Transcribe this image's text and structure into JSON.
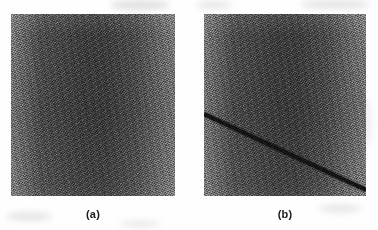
{
  "figure": {
    "width": 378,
    "height": 230,
    "background_color": "#fefefe",
    "panels": [
      {
        "id": "panel-a",
        "caption": "(a)",
        "x": 11,
        "y": 14,
        "width": 164,
        "height": 182,
        "description": "uniform grainy grayscale texture, no defect",
        "mean_gray": "#4c4c4c",
        "edge_gray": "#7a7a7a",
        "center_gray": "#3c3c3c",
        "has_defect": false
      },
      {
        "id": "panel-b",
        "caption": "(b)",
        "x": 204,
        "y": 14,
        "width": 162,
        "height": 182,
        "description": "same grainy grayscale texture with a dark diagonal line defect crossing from the left edge downward to the right edge",
        "mean_gray": "#4c4c4c",
        "edge_gray": "#7a7a7a",
        "center_gray": "#3c3c3c",
        "has_defect": true,
        "defect": {
          "type": "diagonal-line",
          "color": "#141414",
          "thickness_px": 4,
          "start": {
            "x": 0,
            "y": 100
          },
          "end": {
            "x": 162,
            "y": 176
          },
          "slope": 0.47
        }
      }
    ],
    "captions": [
      {
        "label": "(a)",
        "center_x": 93,
        "y": 208
      },
      {
        "label": "(b)",
        "center_x": 285,
        "y": 208
      }
    ]
  }
}
